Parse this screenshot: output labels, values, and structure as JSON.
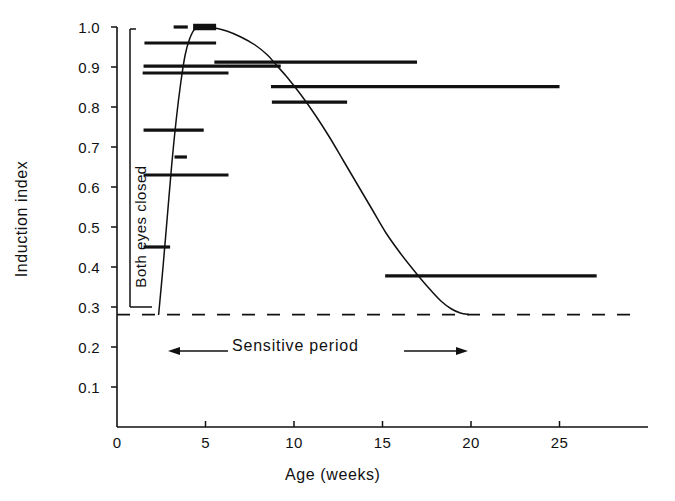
{
  "figure": {
    "background": "#ffffff",
    "ink": "#111111"
  },
  "chart_data": {
    "type": "line",
    "title": "",
    "xlabel": "Age (weeks)",
    "ylabel": "Induction index",
    "xlim": [
      0,
      30
    ],
    "ylim": [
      0,
      1.05
    ],
    "grid": false,
    "legend": null,
    "xticks": [
      0,
      5,
      10,
      15,
      20,
      25
    ],
    "xtick_labels": [
      "0",
      "5",
      "10",
      "15",
      "20",
      "25"
    ],
    "yticks": [
      0.1,
      0.2,
      0.3,
      0.4,
      0.5,
      0.6,
      0.7,
      0.8,
      0.9,
      1.0
    ],
    "ytick_labels": [
      "0.1",
      "0.2",
      "0.3",
      "0.4",
      "0.5",
      "0.6",
      "0.7",
      "0.8",
      "0.9",
      "1.0"
    ],
    "series": [
      {
        "name": "sensitivity curve",
        "style": "solid-thin",
        "points": [
          [
            2.35,
            0.28
          ],
          [
            2.6,
            0.4
          ],
          [
            2.85,
            0.53
          ],
          [
            3.1,
            0.66
          ],
          [
            3.35,
            0.77
          ],
          [
            3.6,
            0.86
          ],
          [
            3.85,
            0.93
          ],
          [
            4.1,
            0.97
          ],
          [
            4.4,
            0.995
          ],
          [
            4.8,
            1.0
          ],
          [
            5.4,
            0.999
          ],
          [
            6.2,
            0.99
          ],
          [
            7.0,
            0.975
          ],
          [
            7.8,
            0.955
          ],
          [
            8.5,
            0.93
          ],
          [
            9.0,
            0.905
          ],
          [
            9.6,
            0.875
          ],
          [
            10.4,
            0.83
          ],
          [
            11.2,
            0.78
          ],
          [
            12.0,
            0.725
          ],
          [
            12.8,
            0.665
          ],
          [
            13.6,
            0.605
          ],
          [
            14.4,
            0.545
          ],
          [
            15.2,
            0.485
          ],
          [
            16.0,
            0.435
          ],
          [
            16.8,
            0.39
          ],
          [
            17.6,
            0.348
          ],
          [
            18.3,
            0.315
          ],
          [
            18.9,
            0.295
          ],
          [
            19.4,
            0.285
          ],
          [
            19.9,
            0.281
          ]
        ]
      }
    ],
    "reference_line": {
      "name": "baseline",
      "style": "dashed",
      "y": 0.281,
      "x_start": 0,
      "x_end": 29.6
    },
    "data_segments": [
      {
        "id": "seg-1",
        "y": 1.0,
        "x_start": 3.2,
        "x_end": 4.0,
        "weight": "thin"
      },
      {
        "id": "seg-2",
        "y": 1.0,
        "x_start": 4.3,
        "x_end": 5.6,
        "weight": "thick"
      },
      {
        "id": "seg-3",
        "y": 0.96,
        "x_start": 1.55,
        "x_end": 5.6,
        "weight": "thin"
      },
      {
        "id": "seg-4",
        "y": 0.912,
        "x_start": 5.5,
        "x_end": 16.95,
        "weight": "thin"
      },
      {
        "id": "seg-5",
        "y": 0.902,
        "x_start": 1.5,
        "x_end": 9.25,
        "weight": "thin"
      },
      {
        "id": "seg-6",
        "y": 0.885,
        "x_start": 1.45,
        "x_end": 6.3,
        "weight": "thin"
      },
      {
        "id": "seg-7",
        "y": 0.851,
        "x_start": 8.7,
        "x_end": 25.0,
        "weight": "thin"
      },
      {
        "id": "seg-8",
        "y": 0.812,
        "x_start": 8.75,
        "x_end": 13.0,
        "weight": "thin"
      },
      {
        "id": "seg-9",
        "y": 0.742,
        "x_start": 1.5,
        "x_end": 4.9,
        "weight": "thin"
      },
      {
        "id": "seg-10",
        "y": 0.675,
        "x_start": 3.25,
        "x_end": 3.95,
        "weight": "thin"
      },
      {
        "id": "seg-11",
        "y": 0.63,
        "x_start": 1.5,
        "x_end": 6.3,
        "weight": "thin"
      },
      {
        "id": "seg-12",
        "y": 0.45,
        "x_start": 1.5,
        "x_end": 3.0,
        "weight": "thin"
      },
      {
        "id": "seg-13",
        "y": 0.378,
        "x_start": 15.15,
        "x_end": 27.1,
        "weight": "thin"
      }
    ]
  },
  "annotations": {
    "both_eyes_closed": "Both eyes closed",
    "sensitive_period": "Sensitive period",
    "left_arrow": "left-arrow",
    "right_arrow": "right-arrow"
  },
  "axes": {
    "x_title": "Age (weeks)",
    "y_title": "Induction index"
  }
}
